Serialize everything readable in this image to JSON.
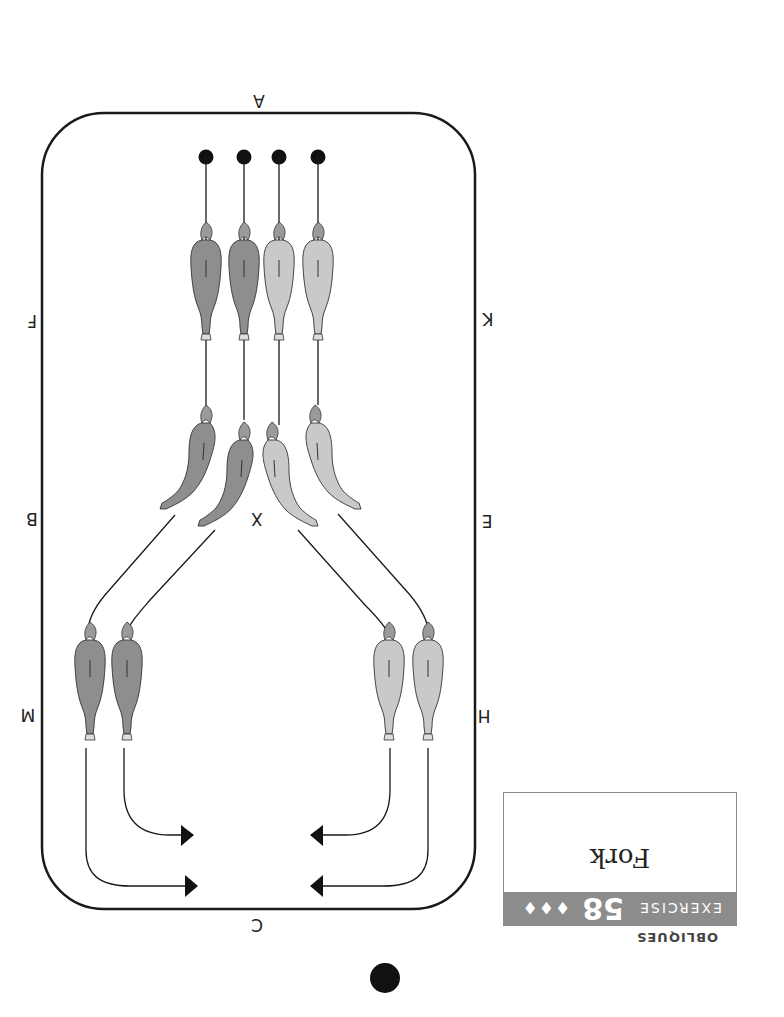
{
  "exercise": {
    "category": "OBLIQUES",
    "label": "EXERCISE",
    "number": "58",
    "difficulty": "♦♦♦",
    "title": "Fork"
  },
  "arena": {
    "letters": {
      "top": "A",
      "bottom": "C",
      "left": [
        "F",
        "B",
        "M"
      ],
      "right": [
        "K",
        "E",
        "H"
      ],
      "center": "X"
    }
  },
  "colors": {
    "dark_horse": "#8a8a8a",
    "light_horse": "#c8c8c8",
    "line": "#1a1a1a",
    "band": "#8c8c8c"
  },
  "orientation": "rotated 180 degrees"
}
